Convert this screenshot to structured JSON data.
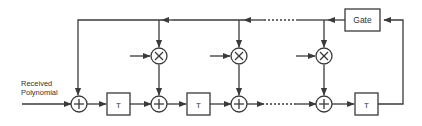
{
  "diagram": {
    "type": "block-diagram",
    "input_label_line1": "Received",
    "input_label_line2": "Polynomial",
    "gate_label": "Gate",
    "delay_label": "T",
    "adder_symbol": "+",
    "multiplier_symbol": "×",
    "colors": {
      "stroke": "#3a3a3a",
      "text": "#333333",
      "background": "#ffffff"
    },
    "blocks": [
      {
        "id": "adder-1",
        "kind": "adder"
      },
      {
        "id": "delay-1",
        "kind": "delay",
        "label": "T"
      },
      {
        "id": "mult-1",
        "kind": "multiplier"
      },
      {
        "id": "adder-2",
        "kind": "adder"
      },
      {
        "id": "delay-2",
        "kind": "delay",
        "label": "T"
      },
      {
        "id": "mult-2",
        "kind": "multiplier"
      },
      {
        "id": "adder-3",
        "kind": "adder"
      },
      {
        "id": "mult-3",
        "kind": "multiplier"
      },
      {
        "id": "adder-4",
        "kind": "adder"
      },
      {
        "id": "delay-3",
        "kind": "delay",
        "label": "T"
      },
      {
        "id": "gate",
        "kind": "gate",
        "label": "Gate"
      }
    ]
  }
}
